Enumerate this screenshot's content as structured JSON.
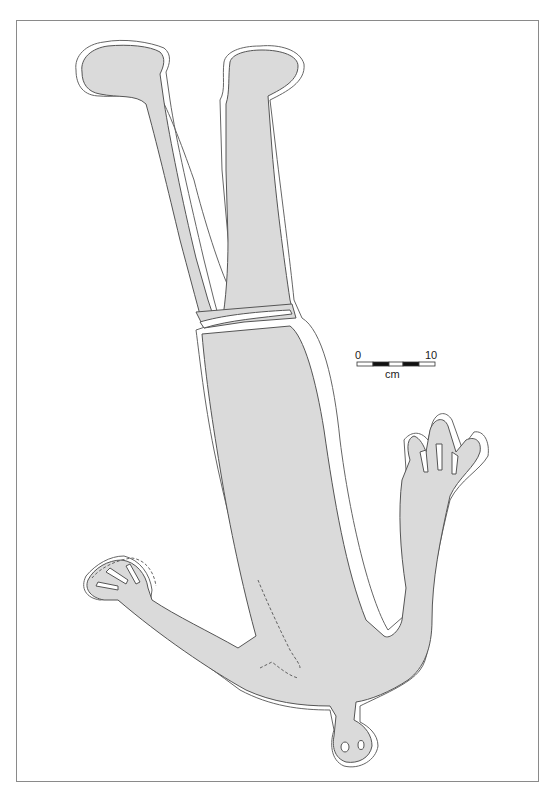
{
  "figure": {
    "colors": {
      "fill": "#dadada",
      "outline": "#555555",
      "frame": "#8a8a8a",
      "background": "#ffffff"
    }
  },
  "scale_bar": {
    "start_label": "0",
    "end_label": "10",
    "unit_label": "cm",
    "segments": [
      "white",
      "black",
      "white",
      "black",
      "white"
    ]
  }
}
